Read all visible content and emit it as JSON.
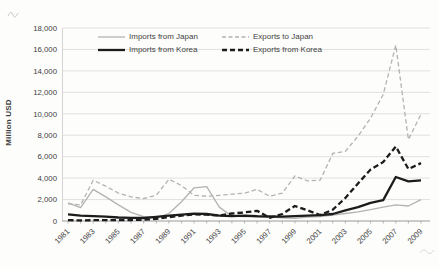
{
  "figure": {
    "background": "#fdfdfc",
    "text_color": "#3f3f3f",
    "gridline_color": "#d9d9d9",
    "axis_color": "#9a9a9a"
  },
  "chart_data": {
    "type": "line",
    "title": "",
    "xlabel": "",
    "ylabel": "Million USD",
    "ylim": [
      0,
      18000
    ],
    "ytick_step": 2000,
    "ytick_labels": [
      "0",
      "2,000",
      "4,000",
      "6,000",
      "8,000",
      "10,000",
      "12,000",
      "14,000",
      "16,000",
      "18,000"
    ],
    "grid": true,
    "legend_position": "top-inside",
    "x_label_every": 2,
    "categories": [
      "1981",
      "1982",
      "1983",
      "1984",
      "1985",
      "1986",
      "1987",
      "1988",
      "1989",
      "1990",
      "1991",
      "1992",
      "1993",
      "1994",
      "1995",
      "1996",
      "1997",
      "1998",
      "1999",
      "2000",
      "2001",
      "2002",
      "2003",
      "2004",
      "2005",
      "2006",
      "2007",
      "2008",
      "2009"
    ],
    "series": [
      {
        "name": "Imports from Japan",
        "color": "#b3b3b3",
        "style": "solid",
        "width": 1.3,
        "values": [
          1700,
          1250,
          2950,
          2250,
          1500,
          800,
          400,
          300,
          700,
          1800,
          3100,
          3200,
          1300,
          450,
          400,
          350,
          350,
          300,
          250,
          350,
          400,
          550,
          700,
          850,
          1050,
          1300,
          1500,
          1400,
          2000
        ]
      },
      {
        "name": "Exports to Japan",
        "color": "#b3b3b3",
        "style": "dashed",
        "width": 1.3,
        "values": [
          1600,
          1500,
          3800,
          3250,
          2600,
          2250,
          2100,
          2400,
          3900,
          3300,
          2400,
          2300,
          2400,
          2500,
          2600,
          2950,
          2300,
          2600,
          4200,
          3750,
          3800,
          6300,
          6500,
          7900,
          9600,
          11800,
          16400,
          7600,
          9950
        ]
      },
      {
        "name": "Imports from Korea",
        "color": "#1c1c1c",
        "style": "solid",
        "width": 2.3,
        "values": [
          620,
          500,
          450,
          400,
          330,
          300,
          280,
          380,
          500,
          600,
          680,
          650,
          500,
          450,
          500,
          450,
          420,
          400,
          450,
          500,
          550,
          650,
          1000,
          1300,
          1700,
          1950,
          4100,
          3700,
          3800
        ]
      },
      {
        "name": "Exports from Korea",
        "color": "#1c1c1c",
        "style": "dashed",
        "width": 2.3,
        "values": [
          80,
          60,
          70,
          80,
          80,
          90,
          120,
          200,
          350,
          500,
          620,
          600,
          500,
          700,
          800,
          950,
          300,
          650,
          1400,
          1000,
          550,
          1050,
          2150,
          3500,
          4800,
          5500,
          6950,
          4850,
          5400
        ]
      }
    ]
  }
}
